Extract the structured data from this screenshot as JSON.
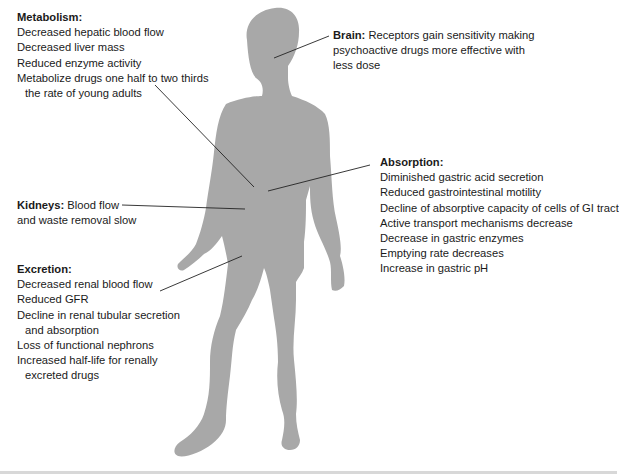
{
  "figure": {
    "silhouette_color": "#a8a8a8",
    "leader_color": "#222222",
    "background": "#ffffff"
  },
  "metabolism": {
    "title": "Metabolism:",
    "lines": [
      "Decreased hepatic blood flow",
      "Decreased liver mass",
      "Reduced enzyme activity",
      "Metabolize drugs one half to two thirds",
      "the rate of young adults"
    ]
  },
  "brain": {
    "title": "Brain:",
    "text_first": " Receptors gain sensitivity making",
    "lines": [
      "psychoactive drugs more effective with",
      "less dose"
    ]
  },
  "absorption": {
    "title": "Absorption:",
    "lines": [
      "Diminished gastric acid secretion",
      "Reduced gastrointestinal motility",
      "Decline of absorptive capacity of cells of GI tract",
      "Active transport mechanisms decrease",
      "Decrease in gastric enzymes",
      "Emptying rate decreases",
      "Increase in gastric pH"
    ]
  },
  "kidneys": {
    "title": "Kidneys:",
    "text_first": " Blood flow",
    "lines": [
      "and waste removal slow"
    ]
  },
  "excretion": {
    "title": "Excretion:",
    "lines": [
      "Decreased renal blood flow",
      "Reduced GFR",
      "Decline in renal tubular secretion",
      "and absorption",
      "Loss of functional nephrons",
      "Increased half-life for renally",
      "excreted drugs"
    ]
  }
}
